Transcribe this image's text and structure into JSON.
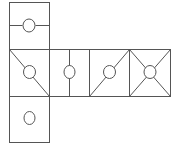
{
  "diagram": {
    "type": "cube-net",
    "stroke_color": "#555555",
    "background": "#ffffff",
    "faces": [
      {
        "id": "top",
        "pattern": "horizontal-midline-with-circle"
      },
      {
        "id": "row-1",
        "pattern": "diagonal-topleft-to-bottomright-with-circle"
      },
      {
        "id": "row-2",
        "pattern": "vertical-midline-with-circle"
      },
      {
        "id": "row-3",
        "pattern": "diagonal-bottomleft-to-topright-with-circle"
      },
      {
        "id": "row-4",
        "pattern": "both-diagonals-with-circle"
      },
      {
        "id": "bottom",
        "pattern": "circle-only"
      }
    ]
  }
}
